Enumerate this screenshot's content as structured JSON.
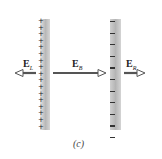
{
  "figure": {
    "caption": "(c)",
    "left_plate": {
      "charge": "positive",
      "sign": "+",
      "sign_count": 17
    },
    "right_plate": {
      "charge": "negative",
      "sign": "−",
      "sign_count": 11
    },
    "fields": [
      {
        "id": "E_L",
        "label": "E",
        "subscript": "L",
        "direction": "left"
      },
      {
        "id": "E_B",
        "label": "E",
        "subscript": "B",
        "direction": "right"
      },
      {
        "id": "E_R",
        "label": "E",
        "subscript": "R",
        "direction": "right"
      }
    ],
    "colors": {
      "plate": "#bcbcbc",
      "arrow": "#555555",
      "text": "#222222"
    }
  }
}
